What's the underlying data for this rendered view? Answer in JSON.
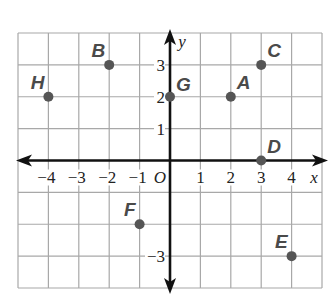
{
  "chart_data": {
    "type": "scatter",
    "title": "",
    "xlabel": "x",
    "ylabel": "y",
    "origin_label": "O",
    "xlim": [
      -5,
      5
    ],
    "ylim": [
      -4,
      4
    ],
    "grid": true,
    "x_ticks": [
      {
        "value": -4,
        "label": "−4"
      },
      {
        "value": -3,
        "label": "−3"
      },
      {
        "value": -2,
        "label": "−2"
      },
      {
        "value": -1,
        "label": "−1"
      },
      {
        "value": 1,
        "label": "1"
      },
      {
        "value": 2,
        "label": "2"
      },
      {
        "value": 3,
        "label": "3"
      },
      {
        "value": 4,
        "label": "4"
      }
    ],
    "y_ticks": [
      {
        "value": 3,
        "label": "3"
      },
      {
        "value": 2,
        "label": "2"
      },
      {
        "value": 1,
        "label": "1"
      },
      {
        "value": -3,
        "label": "−3"
      }
    ],
    "points": [
      {
        "label": "A",
        "x": 2,
        "y": 2
      },
      {
        "label": "B",
        "x": -2,
        "y": 3
      },
      {
        "label": "C",
        "x": 3,
        "y": 3
      },
      {
        "label": "D",
        "x": 3,
        "y": 0
      },
      {
        "label": "E",
        "x": 4,
        "y": -3
      },
      {
        "label": "F",
        "x": -1,
        "y": -2
      },
      {
        "label": "G",
        "x": 0,
        "y": 2
      },
      {
        "label": "H",
        "x": -4,
        "y": 2
      }
    ]
  },
  "colors": {
    "grid": "#a8a8a8",
    "axis": "#111111",
    "point": "#555555",
    "point_label": "#4a4a4a"
  }
}
